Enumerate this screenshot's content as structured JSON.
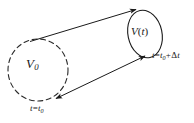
{
  "figure": {
    "name": "material-volume-deformation-diagram",
    "background_color": "#ffffff",
    "stroke_color": "#1a1a1a"
  },
  "shapes": {
    "initial_volume": {
      "name": "dashed-circle",
      "style": "dashed",
      "cx": 38,
      "cy": 70,
      "rx": 30,
      "ry": 31
    },
    "final_volume": {
      "name": "solid-ellipse",
      "style": "solid",
      "cx": 145,
      "cy": 34,
      "rx": 17,
      "ry": 24,
      "rotation": -12
    },
    "connector_top": {
      "name": "top-streamline-arrow",
      "x1": 30,
      "y1": 41,
      "x2": 137,
      "y2": 9,
      "arrow_at": "end"
    },
    "connector_bottom": {
      "name": "bottom-streamline-arrow",
      "x1": 55,
      "y1": 99,
      "x2": 146,
      "y2": 56,
      "arrow_at": "both"
    }
  },
  "labels": {
    "initial_volume": {
      "symbol": "V",
      "subscript": "0",
      "full": "V0"
    },
    "final_volume": {
      "symbol": "V",
      "argument": "t",
      "full": "V(t)"
    },
    "initial_time": {
      "variable": "t",
      "equals": "=",
      "value_symbol": "t",
      "value_subscript": "0",
      "full": "t=t0"
    },
    "final_time": {
      "variable": "t",
      "equals": "=",
      "value_symbol": "t",
      "value_subscript": "0",
      "plus": "+",
      "delta": "Δ",
      "delta_variable": "t",
      "full": "t=t0+Δt"
    }
  }
}
